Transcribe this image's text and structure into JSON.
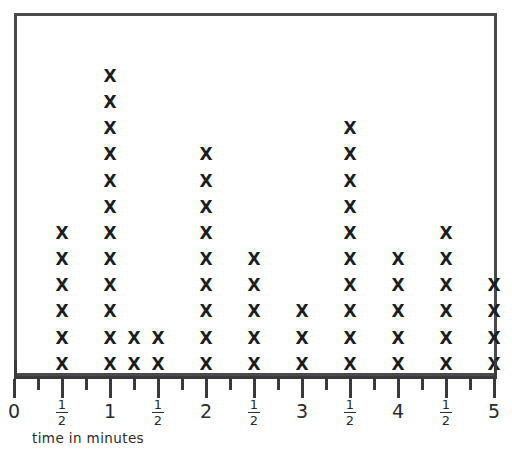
{
  "chart_data": {
    "type": "scatter",
    "plot_kind": "dot-plot",
    "title": "",
    "xlabel": "time in minutes",
    "ylabel": "",
    "grid": false,
    "legend": null,
    "mark_glyph": "X",
    "xlim": [
      0,
      5
    ],
    "x_major_step": 0.5,
    "x_minor_step": 0.25,
    "x_tick_labels": [
      "0",
      "1/2",
      "1",
      "1/2",
      "2",
      "1/2",
      "3",
      "1/2",
      "4",
      "1/2",
      "5"
    ],
    "x_tick_values": [
      0,
      0.5,
      1,
      1.5,
      2,
      2.5,
      3,
      3.5,
      4,
      4.5,
      5
    ],
    "categories": [
      0,
      0.5,
      1,
      1.25,
      1.5,
      2,
      2.5,
      3,
      3.5,
      4,
      4.5,
      5
    ],
    "values": [
      0,
      6,
      12,
      2,
      2,
      9,
      5,
      3,
      10,
      5,
      6,
      4
    ],
    "points": [
      {
        "x": 0,
        "x_label": "0",
        "count": 0
      },
      {
        "x": 0.5,
        "x_label": "1/2",
        "count": 6
      },
      {
        "x": 1,
        "x_label": "1",
        "count": 12
      },
      {
        "x": 1.25,
        "x_label": "1 1/4",
        "count": 2
      },
      {
        "x": 1.5,
        "x_label": "1 1/2",
        "count": 2
      },
      {
        "x": 2,
        "x_label": "2",
        "count": 9
      },
      {
        "x": 2.5,
        "x_label": "2 1/2",
        "count": 5
      },
      {
        "x": 3,
        "x_label": "3",
        "count": 3
      },
      {
        "x": 3.5,
        "x_label": "3 1/2",
        "count": 10
      },
      {
        "x": 4,
        "x_label": "4",
        "count": 5
      },
      {
        "x": 4.5,
        "x_label": "4 1/2",
        "count": 6
      },
      {
        "x": 5,
        "x_label": "5",
        "count": 4
      }
    ],
    "total_marks": 64,
    "colors": {
      "mark": "#1c1c1c",
      "frame": "#4a4a4a",
      "axis": "#3a3a3a",
      "label": "#2b2b2b",
      "background": "#ffffff"
    }
  },
  "axis": {
    "caption": "time in minutes",
    "labels": [
      {
        "text": "0",
        "kind": "int",
        "value": 0
      },
      {
        "text": "1/2",
        "kind": "frac",
        "num": "1",
        "den": "2"
      },
      {
        "text": "1",
        "kind": "int",
        "value": 1
      },
      {
        "text": "1/2",
        "kind": "frac",
        "num": "1",
        "den": "2"
      },
      {
        "text": "2",
        "kind": "int",
        "value": 2
      },
      {
        "text": "1/2",
        "kind": "frac",
        "num": "1",
        "den": "2"
      },
      {
        "text": "3",
        "kind": "int",
        "value": 3
      },
      {
        "text": "1/2",
        "kind": "frac",
        "num": "1",
        "den": "2"
      },
      {
        "text": "4",
        "kind": "int",
        "value": 4
      },
      {
        "text": "1/2",
        "kind": "frac",
        "num": "1",
        "den": "2"
      },
      {
        "text": "5",
        "kind": "int",
        "value": 5
      }
    ]
  },
  "title": ""
}
